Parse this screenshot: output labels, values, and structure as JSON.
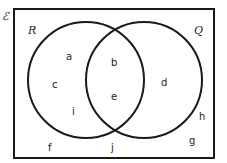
{
  "diagram": {
    "type": "venn",
    "universal_label": "ℰ",
    "sets": [
      {
        "name": "R",
        "label": "R"
      },
      {
        "name": "Q",
        "label": "Q"
      }
    ],
    "regions": {
      "R_only": [
        "a",
        "c",
        "i"
      ],
      "R_and_Q": [
        "b",
        "e"
      ],
      "Q_only": [
        "d"
      ],
      "outside": [
        "h",
        "g",
        "f",
        "j"
      ]
    },
    "elements": {
      "a": "a",
      "b": "b",
      "c": "c",
      "d": "d",
      "e": "e",
      "f": "f",
      "g": "g",
      "h": "h",
      "i": "i",
      "j": "j"
    },
    "colors": {
      "stroke": "#1a1a1a",
      "background": "#ffffff"
    }
  }
}
